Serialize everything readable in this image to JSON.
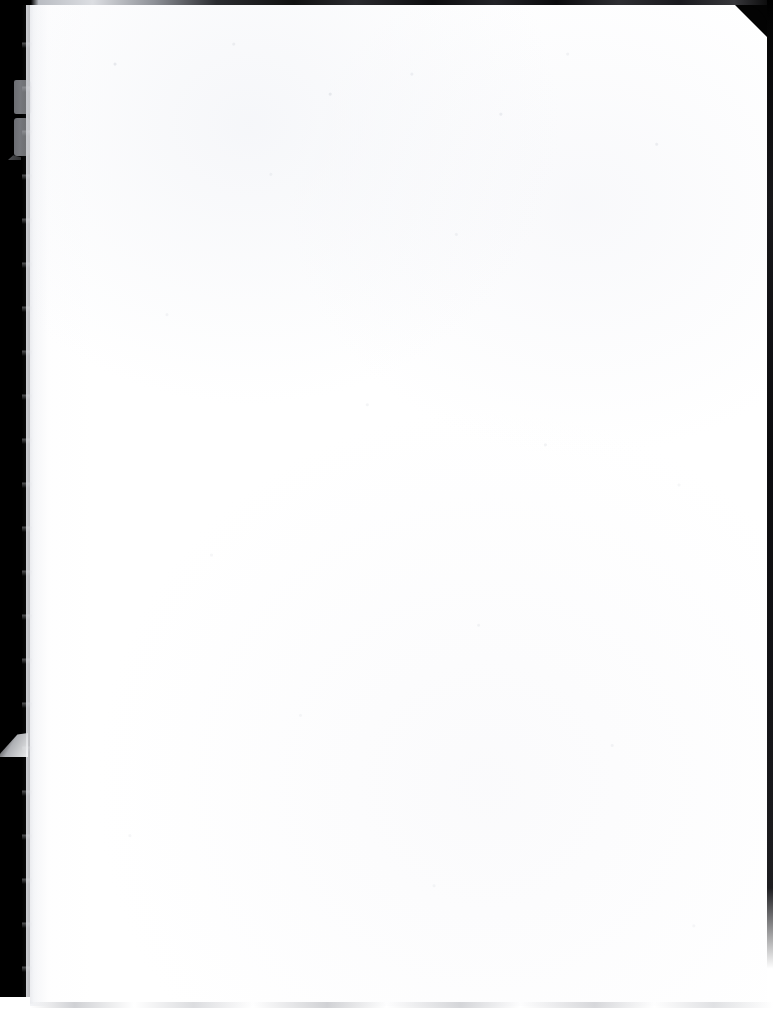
{
  "document": {
    "kind": "scanned-page",
    "page_content": "",
    "page_text": "",
    "description": "Blank scanned page"
  },
  "canvas": {
    "width_px": 773,
    "height_px": 1009,
    "background_color": "#ffffff"
  },
  "page": {
    "paper_color": "#ffffff",
    "left_px": 26,
    "top_px": 4,
    "width_px": 742,
    "height_px": 1002
  },
  "scanner": {
    "gutter_color": "#000000",
    "gutter_width_px": 30,
    "gutter_height_px": 997,
    "top_strip_height_px": 5,
    "right_strip_width_px": 6,
    "bottom_shadow_color": "#aaacb2"
  },
  "artifacts": {
    "corner_clip": "top-right",
    "corner_clip_size_px": 30,
    "edge_blotch_upper": "grey-tear-mark",
    "edge_blotch_lower": "grey-tear-mark",
    "edge_tear_flap": "triangular-flap",
    "edge_nick": "small-nick",
    "speckle": "scan-dust-noise"
  }
}
